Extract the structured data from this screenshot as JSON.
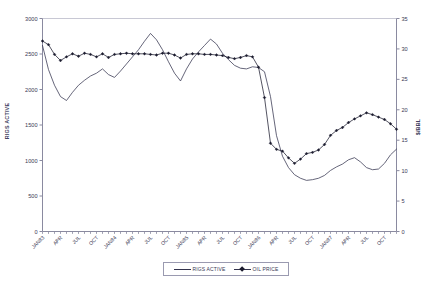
{
  "chart_data": {
    "type": "line",
    "title": "",
    "subtitle": "",
    "xlabel": "",
    "ylabel": "RIGS ACTIVE",
    "y2label": "$/BBL",
    "ylim": [
      0,
      3000
    ],
    "y2lim": [
      0,
      35
    ],
    "ytick_labels": [
      "0",
      "500",
      "1000",
      "1500",
      "2000",
      "2500",
      "3000"
    ],
    "yticks": [
      0,
      500,
      1000,
      1500,
      2000,
      2500,
      3000
    ],
    "y2tick_labels": [
      "0",
      "5",
      "10",
      "15",
      "20",
      "25",
      "30",
      "35"
    ],
    "y2ticks": [
      0,
      5,
      10,
      15,
      20,
      25,
      30,
      35
    ],
    "grid": false,
    "legend_position": "bottom-center",
    "x_tick_labels": [
      "JAN83",
      "APR",
      "JUL",
      "OCT",
      "JAN84",
      "APR",
      "JUL",
      "OCT",
      "JAN85",
      "APR",
      "JUL",
      "OCT",
      "JAN86",
      "APR",
      "JUL",
      "OCT",
      "JAN87",
      "APR",
      "JUL",
      "OCT"
    ],
    "x_tick_indices": [
      0,
      3,
      6,
      9,
      12,
      15,
      18,
      21,
      24,
      27,
      30,
      33,
      36,
      39,
      42,
      45,
      48,
      51,
      54,
      57
    ],
    "x": [
      "JAN83",
      "FEB83",
      "MAR83",
      "APR83",
      "MAY83",
      "JUN83",
      "JUL83",
      "AUG83",
      "SEP83",
      "OCT83",
      "NOV83",
      "DEC83",
      "JAN84",
      "FEB84",
      "MAR84",
      "APR84",
      "MAY84",
      "JUN84",
      "JUL84",
      "AUG84",
      "SEP84",
      "OCT84",
      "NOV84",
      "DEC84",
      "JAN85",
      "FEB85",
      "MAR85",
      "APR85",
      "MAY85",
      "JUN85",
      "JUL85",
      "AUG85",
      "SEP85",
      "OCT85",
      "NOV85",
      "DEC85",
      "JAN86",
      "FEB86",
      "MAR86",
      "APR86",
      "MAY86",
      "JUN86",
      "JUL86",
      "AUG86",
      "SEP86",
      "OCT86",
      "NOV86",
      "DEC86",
      "JAN87",
      "FEB87",
      "MAR87",
      "APR87",
      "MAY87",
      "JUN87",
      "JUL87",
      "AUG87",
      "SEP87",
      "OCT87",
      "NOV87",
      "DEC87"
    ],
    "series": [
      {
        "name": "RIGS ACTIVE",
        "axis": "left",
        "marker": "none",
        "color": "#33334d",
        "values": [
          2620,
          2280,
          2060,
          1900,
          1845,
          1960,
          2060,
          2130,
          2190,
          2230,
          2290,
          2210,
          2170,
          2260,
          2360,
          2460,
          2560,
          2680,
          2790,
          2700,
          2560,
          2390,
          2230,
          2120,
          2290,
          2430,
          2530,
          2620,
          2710,
          2640,
          2510,
          2420,
          2340,
          2300,
          2290,
          2320,
          2310,
          2250,
          1900,
          1350,
          1060,
          900,
          800,
          750,
          720,
          730,
          750,
          790,
          860,
          910,
          950,
          1010,
          1040,
          980,
          900,
          870,
          880,
          960,
          1080,
          1160
        ]
      },
      {
        "name": "OIL PRICE",
        "axis": "right",
        "marker": "diamond",
        "color": "#1b1b2e",
        "values": [
          31.3,
          30.7,
          29.1,
          28.1,
          28.7,
          29.2,
          28.8,
          29.3,
          29.1,
          28.7,
          29.2,
          28.6,
          29.1,
          29.2,
          29.3,
          29.2,
          29.2,
          29.2,
          29.1,
          29.0,
          29.3,
          29.3,
          29.0,
          28.5,
          29.1,
          29.2,
          29.2,
          29.1,
          29.1,
          29.0,
          28.9,
          28.6,
          28.4,
          28.6,
          28.9,
          28.7,
          27.0,
          22.0,
          14.5,
          13.5,
          13.2,
          12.1,
          11.2,
          11.9,
          12.8,
          13.0,
          13.4,
          14.3,
          15.8,
          16.6,
          17.1,
          17.9,
          18.5,
          19.0,
          19.5,
          19.2,
          18.8,
          18.4,
          17.7,
          16.8
        ]
      }
    ],
    "legend": [
      {
        "label": "RIGS ACTIVE",
        "marker": "none"
      },
      {
        "label": "OIL PRICE",
        "marker": "diamond"
      }
    ]
  },
  "axes": {
    "left_title": "RIGS ACTIVE",
    "right_title": "$/BBL"
  },
  "colors": {
    "line": "#33334d",
    "marker": "#1b1b2e",
    "axis": "#8a8aa0",
    "text": "#3a3a55",
    "background": "#ffffff"
  }
}
